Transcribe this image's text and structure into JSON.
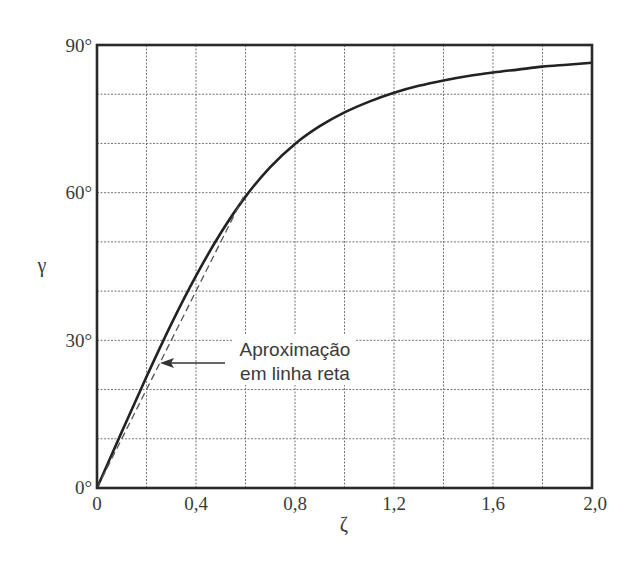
{
  "chart_data": {
    "type": "line",
    "title": "",
    "xlabel": "ζ",
    "ylabel": "γ",
    "xlim": [
      0,
      2.0
    ],
    "ylim": [
      0,
      90
    ],
    "grid": true,
    "x_ticks": [
      0,
      0.4,
      0.8,
      1.2,
      1.6,
      2.0
    ],
    "x_tick_labels": [
      "0",
      "0,4",
      "0,8",
      "1,2",
      "1,6",
      "2,0"
    ],
    "x_grid_step": 0.2,
    "y_ticks": [
      0,
      30,
      60,
      90
    ],
    "y_tick_labels": [
      "0°",
      "30°",
      "60°",
      "90°"
    ],
    "y_grid_step": 10,
    "series": [
      {
        "name": "γ(ζ)",
        "style": "solid",
        "x": [
          0,
          0.1,
          0.2,
          0.3,
          0.4,
          0.5,
          0.6,
          0.7,
          0.8,
          0.9,
          1.0,
          1.1,
          1.2,
          1.3,
          1.4,
          1.5,
          1.6,
          1.7,
          1.8,
          1.9,
          2.0
        ],
        "values": [
          0,
          11.4,
          22.6,
          33.3,
          43.1,
          51.8,
          59.2,
          65.2,
          69.9,
          73.5,
          76.3,
          78.5,
          80.3,
          81.7,
          82.8,
          83.7,
          84.4,
          85.0,
          85.6,
          86.0,
          86.4
        ]
      },
      {
        "name": "Aproximação em linha reta",
        "style": "dashed",
        "x": [
          0,
          0.6
        ],
        "values": [
          0,
          60
        ]
      }
    ],
    "annotations": [
      {
        "text_line1": "Aproximação",
        "text_line2": "em linha reta",
        "arrow_to": [
          0.26,
          25.5
        ]
      }
    ]
  },
  "labels": {
    "xlabel": "ζ",
    "ylabel": "γ",
    "annotation_line1": "Aproximação",
    "annotation_line2": "em linha reta",
    "x_tick_0": "0",
    "x_tick_1": "0,4",
    "x_tick_2": "0,8",
    "x_tick_3": "1,2",
    "x_tick_4": "1,6",
    "x_tick_5": "2,0",
    "y_tick_0": "0°",
    "y_tick_1": "30°",
    "y_tick_2": "60°",
    "y_tick_3": "90°"
  },
  "colors": {
    "curve": "#222222",
    "dashed": "#555555",
    "grid": "#777777",
    "frame": "#2a2a2a"
  }
}
